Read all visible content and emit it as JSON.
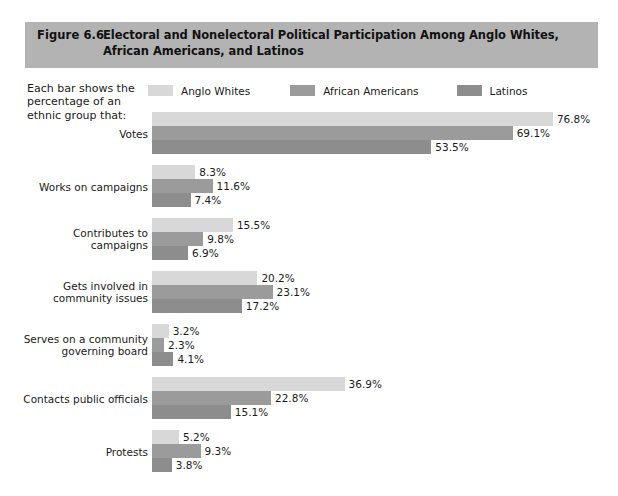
{
  "header": {
    "figure_number": "Figure 6.6",
    "title": "Electoral and Nonelectoral Political Participation Among Anglo Whites, African Americans, and Latinos",
    "band_color": "#b3b3b3"
  },
  "caption": {
    "text": "Each bar shows the percentage of an ethnic group that:"
  },
  "legend": {
    "items": [
      {
        "label": "Anglo Whites",
        "color": "#d8d8d8"
      },
      {
        "label": "African Americans",
        "color": "#9b9b9b"
      },
      {
        "label": "Latinos",
        "color": "#8d8d8d"
      }
    ]
  },
  "chart_data": {
    "type": "bar",
    "orientation": "horizontal",
    "title": "Electoral and Nonelectoral Political Participation Among Anglo Whites, African Americans, and Latinos",
    "xlabel": "",
    "ylabel": "",
    "xlim": [
      0,
      76.8
    ],
    "grid": false,
    "legend_position": "top",
    "value_suffix": "%",
    "categories": [
      "Votes",
      "Works on campaigns",
      "Contributes to campaigns",
      "Gets involved in community issues",
      "Serves on a community governing board",
      "Contacts public officials",
      "Protests"
    ],
    "series": [
      {
        "name": "Anglo Whites",
        "color": "#d8d8d8",
        "values": [
          76.8,
          8.3,
          15.5,
          20.2,
          3.2,
          36.9,
          5.2
        ]
      },
      {
        "name": "African Americans",
        "color": "#9b9b9b",
        "values": [
          69.1,
          11.6,
          9.8,
          23.1,
          2.3,
          22.8,
          9.3
        ]
      },
      {
        "name": "Latinos",
        "color": "#8d8d8d",
        "values": [
          53.5,
          7.4,
          6.9,
          17.2,
          4.1,
          15.1,
          3.8
        ]
      }
    ],
    "groups": [
      {
        "label": "Votes",
        "label_lines": [
          "Votes"
        ],
        "bars": [
          {
            "series": "Anglo Whites",
            "value": 76.8,
            "value_label": "76.8%",
            "color": "#d8d8d8"
          },
          {
            "series": "African Americans",
            "value": 69.1,
            "value_label": "69.1%",
            "color": "#9b9b9b"
          },
          {
            "series": "Latinos",
            "value": 53.5,
            "value_label": "53.5%",
            "color": "#8d8d8d"
          }
        ]
      },
      {
        "label": "Works on campaigns",
        "label_lines": [
          "Works on campaigns"
        ],
        "bars": [
          {
            "series": "Anglo Whites",
            "value": 8.3,
            "value_label": "8.3%",
            "color": "#d8d8d8"
          },
          {
            "series": "African Americans",
            "value": 11.6,
            "value_label": "11.6%",
            "color": "#9b9b9b"
          },
          {
            "series": "Latinos",
            "value": 7.4,
            "value_label": "7.4%",
            "color": "#8d8d8d"
          }
        ]
      },
      {
        "label": "Contributes to campaigns",
        "label_lines": [
          "Contributes to campaigns"
        ],
        "bars": [
          {
            "series": "Anglo Whites",
            "value": 15.5,
            "value_label": "15.5%",
            "color": "#d8d8d8"
          },
          {
            "series": "African Americans",
            "value": 9.8,
            "value_label": "9.8%",
            "color": "#9b9b9b"
          },
          {
            "series": "Latinos",
            "value": 6.9,
            "value_label": "6.9%",
            "color": "#8d8d8d"
          }
        ]
      },
      {
        "label": "Gets involved in community issues",
        "label_lines": [
          "Gets involved in",
          "community issues"
        ],
        "bars": [
          {
            "series": "Anglo Whites",
            "value": 20.2,
            "value_label": "20.2%",
            "color": "#d8d8d8"
          },
          {
            "series": "African Americans",
            "value": 23.1,
            "value_label": "23.1%",
            "color": "#9b9b9b"
          },
          {
            "series": "Latinos",
            "value": 17.2,
            "value_label": "17.2%",
            "color": "#8d8d8d"
          }
        ]
      },
      {
        "label": "Serves on a community governing board",
        "label_lines": [
          "Serves on a community",
          "governing board"
        ],
        "bars": [
          {
            "series": "Anglo Whites",
            "value": 3.2,
            "value_label": "3.2%",
            "color": "#d8d8d8"
          },
          {
            "series": "African Americans",
            "value": 2.3,
            "value_label": "2.3%",
            "color": "#9b9b9b"
          },
          {
            "series": "Latinos",
            "value": 4.1,
            "value_label": "4.1%",
            "color": "#8d8d8d"
          }
        ]
      },
      {
        "label": "Contacts public officials",
        "label_lines": [
          "Contacts public officials"
        ],
        "bars": [
          {
            "series": "Anglo Whites",
            "value": 36.9,
            "value_label": "36.9%",
            "color": "#d8d8d8"
          },
          {
            "series": "African Americans",
            "value": 22.8,
            "value_label": "22.8%",
            "color": "#9b9b9b"
          },
          {
            "series": "Latinos",
            "value": 15.1,
            "value_label": "15.1%",
            "color": "#8d8d8d"
          }
        ]
      },
      {
        "label": "Protests",
        "label_lines": [
          "Protests"
        ],
        "bars": [
          {
            "series": "Anglo Whites",
            "value": 5.2,
            "value_label": "5.2%",
            "color": "#d8d8d8"
          },
          {
            "series": "African Americans",
            "value": 9.3,
            "value_label": "9.3%",
            "color": "#9b9b9b"
          },
          {
            "series": "Latinos",
            "value": 3.8,
            "value_label": "3.8%",
            "color": "#8d8d8d"
          }
        ]
      }
    ]
  },
  "scale": {
    "px_per_percent": 5.22
  }
}
